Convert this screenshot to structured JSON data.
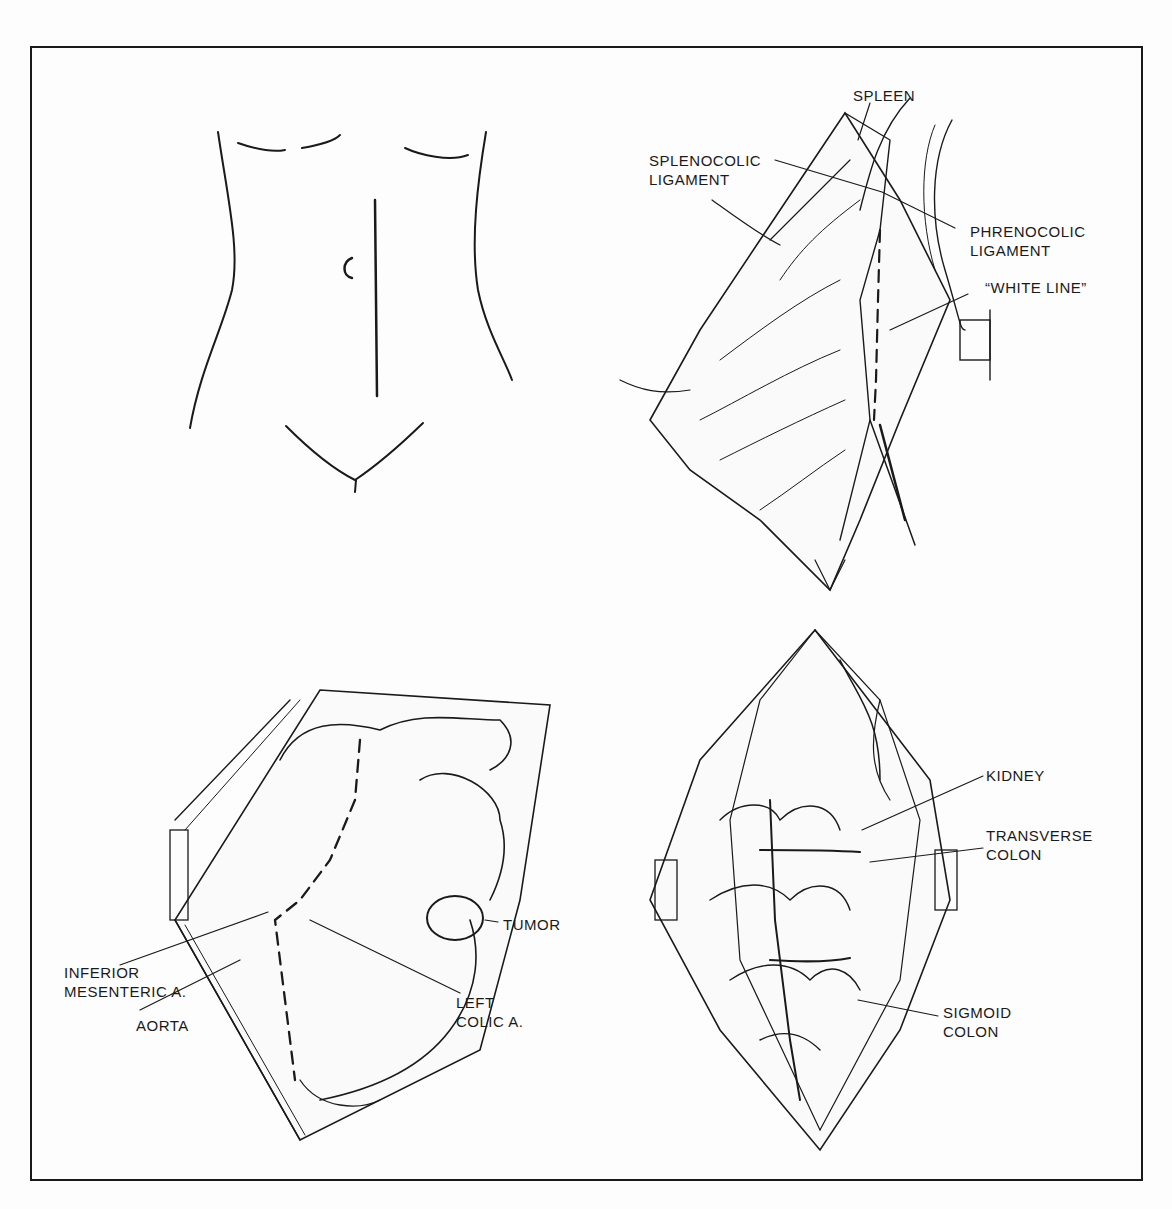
{
  "figure": {
    "panels": [
      {
        "id": "incision",
        "labels": []
      },
      {
        "id": "mobilization",
        "labels": [
          {
            "key": "spleen",
            "text": "SPLEEN"
          },
          {
            "key": "splenocolic",
            "line1": "SPLENOCOLIC",
            "line2": "LIGAMENT"
          },
          {
            "key": "phrenocolic",
            "line1": "PHRENOCOLIC",
            "line2": "LIGAMENT"
          },
          {
            "key": "white_line",
            "text": "“WHITE LINE”"
          }
        ]
      },
      {
        "id": "resection",
        "labels": [
          {
            "key": "tumor",
            "text": "TUMOR"
          },
          {
            "key": "ima",
            "line1": "INFERIOR",
            "line2": "MESENTERIC A."
          },
          {
            "key": "aorta",
            "text": "AORTA"
          },
          {
            "key": "left_colic",
            "line1": "LEFT",
            "line2": "COLIC A."
          }
        ]
      },
      {
        "id": "anastomosis",
        "labels": [
          {
            "key": "kidney",
            "text": "KIDNEY"
          },
          {
            "key": "transverse",
            "line1": "TRANSVERSE",
            "line2": "COLON"
          },
          {
            "key": "sigmoid",
            "line1": "SIGMOID",
            "line2": "COLON"
          }
        ]
      }
    ]
  },
  "colors": {
    "ink": "#1a1a1a",
    "paper": "#fdfdfd"
  }
}
